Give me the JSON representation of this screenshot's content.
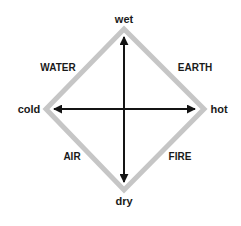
{
  "diagram": {
    "type": "four-elements-qualities-diamond",
    "colors": {
      "diamond_stroke": "#c6c6c6",
      "axis": "#141414",
      "text": "#1a1a1a",
      "background": "#ffffff"
    },
    "axes": {
      "vertical": {
        "top": "wet",
        "bottom": "dry"
      },
      "horizontal": {
        "left": "cold",
        "right": "hot"
      }
    },
    "elements": {
      "top_left": "WATER",
      "top_right": "EARTH",
      "bottom_left": "AIR",
      "bottom_right": "FIRE"
    }
  }
}
